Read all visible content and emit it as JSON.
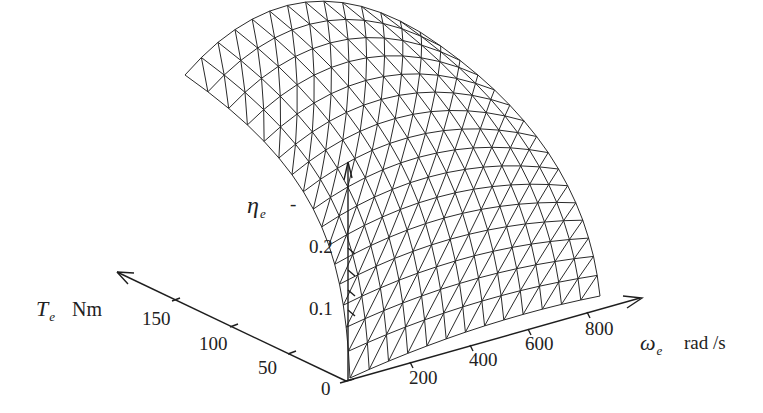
{
  "chart_data": {
    "type": "surface3d",
    "title": "",
    "z_axis": {
      "label": "η",
      "label_sub": "e",
      "unit": "-",
      "ticks": [
        "0.1",
        "0.2"
      ]
    },
    "x_axis": {
      "label": "ω",
      "label_sub": "e",
      "unit": "rad /s",
      "ticks": [
        "200",
        "400",
        "600",
        "800"
      ]
    },
    "y_axis": {
      "label": "T",
      "label_sub": "e",
      "unit": "Nm",
      "ticks": [
        "0",
        "50",
        "100",
        "150"
      ]
    },
    "grid": false,
    "surface": {
      "style": "triangulated wireframe mesh",
      "cols": 13,
      "rows": 16,
      "description": "Engine efficiency rises steeply with torque at low torque and saturates at high torque; roughly flat to slightly decreasing with speed; peak efficiency near 0.35 at high torque"
    },
    "x_range": [
      0,
      900
    ],
    "y_range": [
      0,
      180
    ],
    "z_range": [
      0,
      0.35
    ],
    "colors": {
      "line": "#2a2a2a",
      "background": "#ffffff"
    }
  }
}
